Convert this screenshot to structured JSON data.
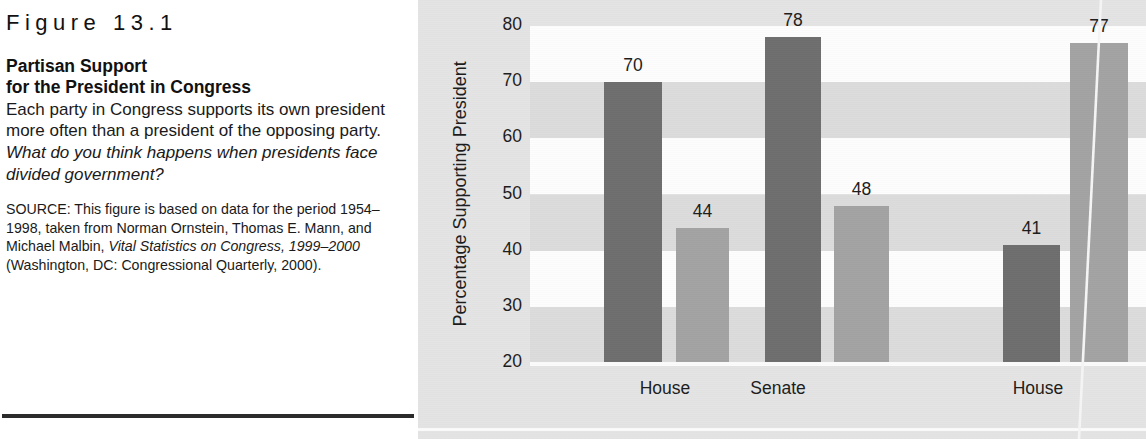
{
  "caption": {
    "figure_number": "Figure 13.1",
    "title_line1": "Partisan Support",
    "title_line2": "for the President in Congress",
    "description_plain": "Each party in Congress supports its own president more often than a president of the opposing party. ",
    "description_question": "What do you think happens when presidents face divided government?",
    "source_prefix": "SOURCE: This figure is based on data for the period 1954–1998, taken from Norman Ornstein, Thomas E. Mann, and Michael Malbin, ",
    "source_italic1": "Vital Statistics on Congress, 1999–2000",
    "source_suffix": " (Washington, DC: Congressional Quarterly, 2000)."
  },
  "chart_data": {
    "type": "bar",
    "title": "Partisan Support for the President in Congress",
    "xlabel": "",
    "ylabel": "Percentage Supporting President",
    "ylim": [
      20,
      80
    ],
    "yticks": [
      80,
      70,
      60,
      50,
      40,
      30,
      20
    ],
    "grid": "alternating-horizontal-bands",
    "legend_position": "none",
    "categories": [
      "House",
      "Senate",
      "House"
    ],
    "series": [
      {
        "name": "President's own party",
        "color": "#6e6e6e",
        "values": [
          70,
          78,
          41
        ]
      },
      {
        "name": "Opposing party",
        "color": "#a3a3a3",
        "values": [
          44,
          48,
          77
        ]
      }
    ],
    "bars": [
      {
        "value": 70,
        "label": "70",
        "group": "House",
        "series": "President's own party",
        "color": "#6e6e6e",
        "x": 604,
        "width": 58
      },
      {
        "value": 44,
        "label": "44",
        "group": "House",
        "series": "Opposing party",
        "color": "#a3a3a3",
        "x": 676,
        "width": 53
      },
      {
        "value": 78,
        "label": "78",
        "group": "Senate",
        "series": "President's own party",
        "color": "#6e6e6e",
        "x": 765,
        "width": 56
      },
      {
        "value": 48,
        "label": "48",
        "group": "Senate",
        "series": "Opposing party",
        "color": "#a3a3a3",
        "x": 834,
        "width": 55
      },
      {
        "value": 41,
        "label": "41",
        "group": "House",
        "series": "President's own party",
        "color": "#6e6e6e",
        "x": 1003,
        "width": 57
      },
      {
        "value": 77,
        "label": "77",
        "group": "House",
        "series": "Opposing party",
        "color": "#a3a3a3",
        "x": 1070,
        "width": 58
      }
    ],
    "category_label_positions": [
      665,
      778,
      1038
    ]
  },
  "colors": {
    "chart_background": "#e4e4e4",
    "band_light": "#fdfdfd",
    "band_dark": "#dcdcdc",
    "bar_dark": "#6e6e6e",
    "bar_light": "#a3a3a3",
    "text": "#1c1c1c",
    "rule": "#2b2b2b"
  }
}
